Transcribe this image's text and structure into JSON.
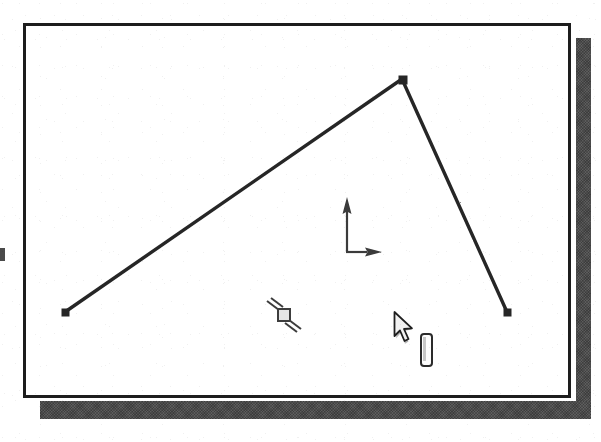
{
  "app": {
    "kind": "cad-sketch-viewport",
    "title": "",
    "background_color": "#ffffff"
  },
  "window": {
    "frame_color": "#1d1d1d",
    "frame_border_px": 3,
    "interior_color": "#ffffff",
    "shadow_color": "#4a4a4a",
    "bounds": {
      "x": 23,
      "y": 23,
      "width": 548,
      "height": 375
    }
  },
  "viewport": {
    "name": "sketch-canvas",
    "geometry": {
      "type": "triangle",
      "name": "triangle-shape",
      "stroke_color": "#262626",
      "stroke_width": 3,
      "vertices": [
        {
          "name": "vertex-left",
          "x": 65,
          "y": 312
        },
        {
          "name": "vertex-apex",
          "x": 402,
          "y": 79
        },
        {
          "name": "vertex-right",
          "x": 507,
          "y": 312
        }
      ],
      "edges": [
        {
          "name": "edge-hypotenuse",
          "from": "vertex-left",
          "to": "vertex-apex",
          "state": "normal",
          "color": "#262626"
        },
        {
          "name": "edge-right",
          "from": "vertex-apex",
          "to": "vertex-right",
          "state": "normal",
          "color": "#262626"
        },
        {
          "name": "edge-base",
          "from": "vertex-left",
          "to": "vertex-right",
          "state": "selected",
          "color": "#8a8a8a"
        }
      ],
      "vertex_marker": {
        "shape": "square",
        "size": 7,
        "color": "#262626"
      }
    },
    "axis_indicator": {
      "name": "coordinate-axis-icon",
      "origin": {
        "x": 344,
        "y": 249
      },
      "color": "#3a3a3a",
      "axes": [
        {
          "name": "y-axis-arrow",
          "direction": "up",
          "length": 50
        },
        {
          "name": "x-axis-arrow",
          "direction": "right",
          "length": 22
        }
      ]
    },
    "snap_marker": {
      "name": "snap-constraint-marker",
      "label": "perpendicular-snap",
      "x": 281,
      "y": 311,
      "square_size": 11,
      "tick_count": 2,
      "color": "#3d3d3d"
    },
    "cursor": {
      "name": "mouse-pointer",
      "x": 393,
      "y": 311,
      "fill": "#f2f2f2",
      "stroke": "#1f1f1f",
      "shadow_color": "#b4b4b4"
    },
    "tooltip_badge": {
      "name": "tooltip-pill",
      "x": 420,
      "y": 333,
      "width": 9,
      "height": 30,
      "border_color": "#2b2b2b"
    }
  },
  "artifacts": {
    "left_edge_mark": {
      "name": "scan-artifact",
      "x": 0,
      "y": 248,
      "width": 5,
      "height": 13
    }
  }
}
